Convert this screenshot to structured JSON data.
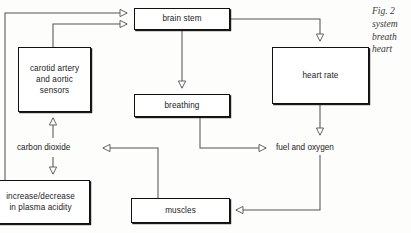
{
  "figure": {
    "caption_lines": [
      "Fig. 2",
      "system",
      "breath",
      "heart"
    ]
  },
  "diagram": {
    "nodes": [
      {
        "id": "brain-stem",
        "label": "brain stem",
        "boxed": true,
        "x": 134,
        "y": 8,
        "w": 96,
        "h": 22
      },
      {
        "id": "carotid-sensors",
        "label": "carotid artery\nand aortic\nsensors",
        "boxed": true,
        "x": 18,
        "y": 47,
        "w": 73,
        "h": 65
      },
      {
        "id": "heart-rate",
        "label": "heart rate",
        "boxed": true,
        "x": 272,
        "y": 47,
        "w": 97,
        "h": 57
      },
      {
        "id": "breathing",
        "label": "breathing",
        "boxed": true,
        "x": 134,
        "y": 94,
        "w": 96,
        "h": 23
      },
      {
        "id": "carbon-dioxide",
        "label": "carbon dioxide",
        "boxed": false,
        "x": 17,
        "y": 141,
        "w": 79,
        "h": 13
      },
      {
        "id": "fuel-and-oxygen",
        "label": "fuel and oxygen",
        "boxed": false,
        "x": 276,
        "y": 141,
        "w": 84,
        "h": 13
      },
      {
        "id": "plasma-acidity",
        "label": "increase/decrease\nin plasma acidity",
        "boxed": true,
        "x": -9,
        "y": 180,
        "w": 99,
        "h": 44
      },
      {
        "id": "muscles",
        "label": "muscles",
        "boxed": true,
        "x": 131,
        "y": 198,
        "w": 99,
        "h": 25
      }
    ],
    "edges": [
      {
        "from": "plasma-acidity",
        "to": "brain-stem",
        "style": "orthogonal-up-right"
      },
      {
        "from": "carotid-sensors",
        "to": "brain-stem",
        "style": "orthogonal-up-right"
      },
      {
        "from": "brain-stem",
        "to": "heart-rate",
        "style": "orthogonal-right-down"
      },
      {
        "from": "brain-stem",
        "to": "breathing",
        "style": "straight-down"
      },
      {
        "from": "heart-rate",
        "to": "fuel-and-oxygen",
        "style": "straight-down"
      },
      {
        "from": "breathing",
        "to": "fuel-and-oxygen",
        "style": "orthogonal-down-right"
      },
      {
        "from": "fuel-and-oxygen",
        "to": "muscles",
        "style": "orthogonal-down-left"
      },
      {
        "from": "muscles",
        "to": "carbon-dioxide",
        "style": "orthogonal-up-left"
      },
      {
        "from": "carbon-dioxide",
        "to": "carotid-sensors",
        "style": "straight-up"
      },
      {
        "from": "carbon-dioxide",
        "to": "plasma-acidity",
        "style": "straight-down"
      }
    ]
  },
  "colors": {
    "line": "#555555",
    "box_border": "#111111",
    "text": "#1a1a1a",
    "caption_text": "#3a3a3a",
    "background": "#fdfdfc"
  }
}
